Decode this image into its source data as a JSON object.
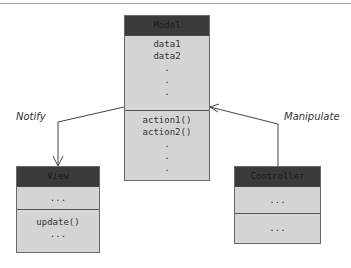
{
  "model": {
    "title": "Model",
    "attributes": [
      "data1",
      "data2",
      ".",
      " .",
      "."
    ],
    "methods": [
      "action1()",
      "action2()",
      ".",
      ".",
      "."
    ]
  },
  "view": {
    "title": "View",
    "attributes": "...",
    "methods": [
      "update()",
      "..."
    ]
  },
  "controller": {
    "title": "Controller",
    "attributes": "...",
    "methods": "..."
  },
  "arrows": {
    "notify": "Notify",
    "manipulate": "Manipulate"
  }
}
